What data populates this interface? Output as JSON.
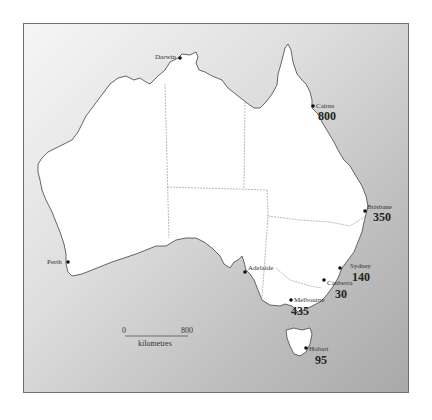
{
  "map": {
    "title": "Australia",
    "colors": {
      "land": "#ffffff",
      "sea_light": "#f6f6f6",
      "sea_dark": "#a9a9a9",
      "coastline": "#555555",
      "state_border": "#8a8a8a"
    },
    "cities": [
      {
        "name": "Darwin",
        "value": ""
      },
      {
        "name": "Cairns",
        "value": "800"
      },
      {
        "name": "Brisbane",
        "value": "350"
      },
      {
        "name": "Sydney",
        "value": "140"
      },
      {
        "name": "Canberra",
        "value": "30"
      },
      {
        "name": "Melbourne",
        "value": "435"
      },
      {
        "name": "Hobart",
        "value": "95"
      },
      {
        "name": "Adelaide",
        "value": ""
      },
      {
        "name": "Perth",
        "value": ""
      }
    ],
    "scale_bar": {
      "start_label": "0",
      "end_label": "800",
      "unit_label": "kilometres"
    }
  }
}
